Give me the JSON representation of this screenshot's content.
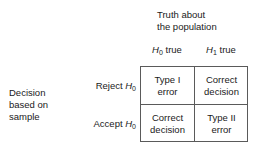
{
  "figure": {
    "background_color": "#ffffff",
    "text_color": "#1a1a1a",
    "border_color": "#5a5a5a"
  },
  "column_group": {
    "label": "Truth about\nthe population"
  },
  "row_group": {
    "label": "Decision\nbased on\nsample"
  },
  "columns": [
    {
      "symbol": "H",
      "subscript": "0",
      "suffix": " true",
      "label": "H0 true"
    },
    {
      "symbol": "H",
      "subscript": "1",
      "suffix": " true",
      "label": "H1 true"
    }
  ],
  "rows": [
    {
      "verb": "Reject ",
      "symbol": "H",
      "subscript": "0",
      "label": "Reject H0"
    },
    {
      "verb": "Accept ",
      "symbol": "H",
      "subscript": "0",
      "label": "Accept H0"
    }
  ],
  "cells": {
    "r0c0": "Type I\nerror",
    "r0c1": "Correct\ndecision",
    "r1c0": "Correct\ndecision",
    "r1c1": "Type II\nerror"
  }
}
